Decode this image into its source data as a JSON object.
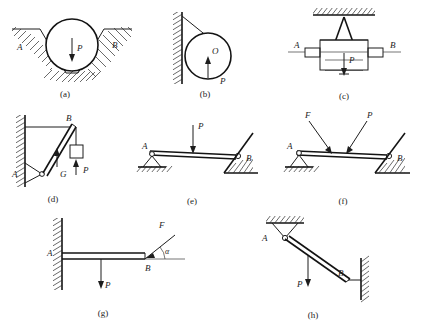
{
  "figure": {
    "panel_count": 8,
    "captions": {
      "a": "(a)",
      "b": "(b)",
      "c": "(c)",
      "d": "(d)",
      "e": "(e)",
      "f": "(f)",
      "g": "(g)",
      "h": "(h)"
    },
    "panels": [
      {
        "id": "a",
        "caption": "(a)",
        "description": "Sphere resting in a V-shaped notch between two inclined hatched ground surfaces",
        "labels": [
          {
            "text": "A",
            "role": "left-contact-point"
          },
          {
            "text": "B",
            "role": "right-contact-point"
          },
          {
            "text": "P",
            "role": "applied-load"
          }
        ]
      },
      {
        "id": "b",
        "caption": "(b)",
        "description": "Sphere hung by a cord against a vertical hatched wall",
        "labels": [
          {
            "text": "O",
            "role": "sphere-center"
          },
          {
            "text": "P",
            "role": "applied-load"
          }
        ]
      },
      {
        "id": "c",
        "caption": "(c)",
        "description": "Trapezoidal wedge block suspended from hatched ceiling, shaft A to B through block",
        "labels": [
          {
            "text": "A",
            "role": "left-shaft-end"
          },
          {
            "text": "B",
            "role": "right-shaft-end"
          },
          {
            "text": "P",
            "role": "applied-load"
          }
        ]
      },
      {
        "id": "d",
        "caption": "(d)",
        "description": "Bracket on vertical hatched wall, inclined rod pinned at A with horizontal tie to B and hanging block",
        "labels": [
          {
            "text": "A",
            "role": "wall-pin"
          },
          {
            "text": "B",
            "role": "upper-joint"
          },
          {
            "text": "G",
            "role": "rod-weight"
          },
          {
            "text": "P",
            "role": "hanging-load"
          }
        ]
      },
      {
        "id": "e",
        "caption": "(e)",
        "description": "Horizontal beam on pin support at A and inclined hatched surface at B with vertical load P",
        "labels": [
          {
            "text": "A",
            "role": "pin-support"
          },
          {
            "text": "B",
            "role": "inclined-support"
          },
          {
            "text": "P",
            "role": "applied-load"
          }
        ]
      },
      {
        "id": "f",
        "caption": "(f)",
        "description": "Horizontal beam on pin support at A and inclined hatched surface at B with two inclined forces F and P",
        "labels": [
          {
            "text": "A",
            "role": "pin-support"
          },
          {
            "text": "B",
            "role": "inclined-support"
          },
          {
            "text": "F",
            "role": "inclined-force"
          },
          {
            "text": "P",
            "role": "inclined-force"
          }
        ]
      },
      {
        "id": "g",
        "caption": "(g)",
        "description": "Cantilever beam fixed in hatched wall at A, vertical load P, inclined force F at angle alpha at B",
        "labels": [
          {
            "text": "A",
            "role": "fixed-end"
          },
          {
            "text": "B",
            "role": "free-end"
          },
          {
            "text": "F",
            "role": "inclined-force"
          },
          {
            "text": "P",
            "role": "applied-load"
          },
          {
            "text": "α",
            "role": "force-angle"
          }
        ]
      },
      {
        "id": "h",
        "caption": "(h)",
        "description": "Inclined rod pinned to hatched ceiling at A, roller at B on vertical hatched wall, vertical load P",
        "labels": [
          {
            "text": "A",
            "role": "ceiling-pin"
          },
          {
            "text": "B",
            "role": "wall-roller"
          },
          {
            "text": "P",
            "role": "applied-load"
          }
        ]
      }
    ]
  }
}
